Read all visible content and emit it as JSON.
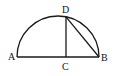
{
  "diagram": {
    "type": "geometry",
    "points": {
      "A": {
        "label": "A"
      },
      "B": {
        "label": "B"
      },
      "C": {
        "label": "C"
      },
      "D": {
        "label": "D"
      }
    },
    "segments": [
      "AB",
      "DC",
      "DB"
    ],
    "arcs": [
      "semicircle AB"
    ],
    "stroke_color": "#1a1a1a"
  }
}
